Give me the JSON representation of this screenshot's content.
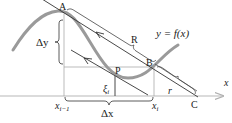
{
  "diagram": {
    "curve_label": "y = f(x)",
    "axis_label": "x",
    "points": {
      "A": "A",
      "B": "B",
      "C": "C",
      "P": "P"
    },
    "braces": {
      "delta_y": "Δy",
      "delta_x": "Δx",
      "R": "R",
      "r": "r"
    },
    "ticks": {
      "x_prev_base": "x",
      "x_prev_sub": "i−1",
      "x_i_base": "x",
      "x_i_sub": "i"
    },
    "xi": {
      "base": "ξ",
      "sub": "i"
    },
    "colors": {
      "curve": "#9a9a9a",
      "lines": "#333333",
      "axis": "#b0b0b0",
      "guides": "#aaaaaa"
    }
  }
}
